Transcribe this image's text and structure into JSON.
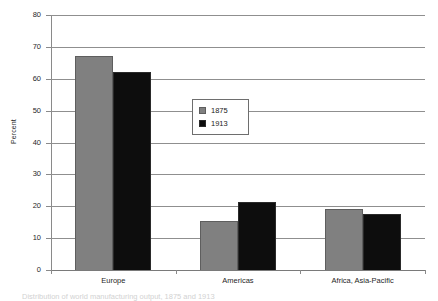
{
  "chart_data": {
    "type": "bar",
    "title": "",
    "xlabel": "",
    "ylabel": "Percent",
    "ylim": [
      0,
      80
    ],
    "ytick_step": 10,
    "yticks": [
      80,
      70,
      60,
      50,
      40,
      30,
      20,
      10,
      0
    ],
    "grid": true,
    "legend_position": "center",
    "categories": [
      "Europe",
      "Americas",
      "Africa, Asia-Pacific"
    ],
    "series": [
      {
        "name": "1875",
        "color": "#808080",
        "values": [
          67,
          15.3,
          19
        ]
      },
      {
        "name": "1913",
        "color": "#0d0d0d",
        "values": [
          62,
          21.3,
          17.7
        ]
      }
    ]
  },
  "legend": {
    "entries": [
      {
        "label": "1875"
      },
      {
        "label": "1913"
      }
    ]
  },
  "axis": {
    "y_title": "Percent"
  },
  "caption": {
    "text": "Distribution of world manufacturing output, 1875 and 1913"
  }
}
